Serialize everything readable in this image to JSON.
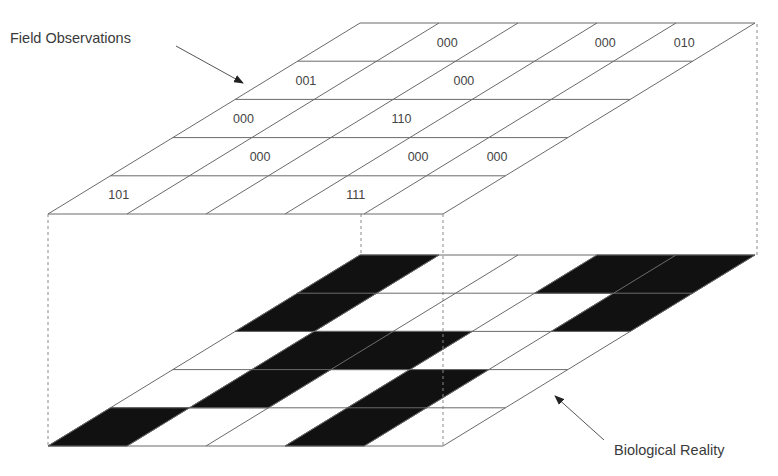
{
  "figure": {
    "labels": {
      "field_observations": "Field Observations",
      "biological_reality": "Biological Reality"
    },
    "grid": {
      "rows": 5,
      "cols": 5,
      "row_order": "row 0 = front (nearest viewer), row 4 = back",
      "col_order": "col 0 = left"
    },
    "field_observations_grid": {
      "cells": [
        {
          "row": 0,
          "col": 0,
          "code": "101"
        },
        {
          "row": 0,
          "col": 3,
          "code": "111"
        },
        {
          "row": 1,
          "col": 1,
          "code": "000"
        },
        {
          "row": 1,
          "col": 3,
          "code": "000"
        },
        {
          "row": 1,
          "col": 4,
          "code": "000"
        },
        {
          "row": 2,
          "col": 0,
          "code": "000"
        },
        {
          "row": 2,
          "col": 2,
          "code": "110"
        },
        {
          "row": 3,
          "col": 0,
          "code": "001"
        },
        {
          "row": 3,
          "col": 2,
          "code": "000"
        },
        {
          "row": 4,
          "col": 1,
          "code": "000"
        },
        {
          "row": 4,
          "col": 3,
          "code": "000"
        },
        {
          "row": 4,
          "col": 4,
          "code": "010"
        }
      ]
    },
    "biological_reality_grid": {
      "occupied_cells": [
        {
          "row": 0,
          "col": 0
        },
        {
          "row": 0,
          "col": 3
        },
        {
          "row": 1,
          "col": 1
        },
        {
          "row": 1,
          "col": 3
        },
        {
          "row": 2,
          "col": 1
        },
        {
          "row": 2,
          "col": 2
        },
        {
          "row": 3,
          "col": 0
        },
        {
          "row": 3,
          "col": 4
        },
        {
          "row": 4,
          "col": 0
        },
        {
          "row": 4,
          "col": 3
        },
        {
          "row": 4,
          "col": 4
        }
      ],
      "occupied_color": "#111111",
      "empty_color": "#ffffff"
    },
    "colors": {
      "line": "#6a6a6a",
      "text": "#444444",
      "fill": "#111111"
    }
  }
}
